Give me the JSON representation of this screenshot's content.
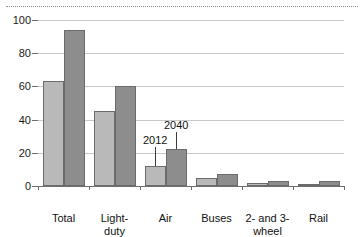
{
  "chart_data": {
    "type": "bar",
    "title": "",
    "subtitle": "",
    "xlabel": "",
    "ylabel": "",
    "ylim": [
      0,
      100
    ],
    "yticks": [
      0,
      20,
      40,
      60,
      80,
      100
    ],
    "ytick_labels": [
      "0",
      "20",
      "40",
      "60",
      "80",
      "100"
    ],
    "grid": true,
    "legend_position": "inline-annotation",
    "categories": [
      "Total",
      "Light-\nduty\nvehicles",
      "Air",
      "Buses",
      "2- and 3-\nwheel\nvehicles",
      "Rail"
    ],
    "series": [
      {
        "name": "2012",
        "color": "#b9b9b9",
        "values": [
          63,
          45,
          12,
          5,
          2,
          1
        ]
      },
      {
        "name": "2040",
        "color": "#8d8d8d",
        "values": [
          94,
          60,
          22,
          7,
          3,
          3
        ]
      }
    ],
    "annotations": [
      {
        "text": "2012",
        "series": "2012",
        "category": "Air"
      },
      {
        "text": "2040",
        "series": "2040",
        "category": "Air"
      }
    ]
  },
  "colors": {
    "series_2012": "#b9b9b9",
    "series_2040": "#8d8d8d",
    "bar_outline": "#6b6b6b",
    "gridline": "#c8c8c8",
    "axis": "#6e6e6e",
    "text": "#111111",
    "top_rule": "#8d8d8d",
    "background": "#ffffff"
  }
}
